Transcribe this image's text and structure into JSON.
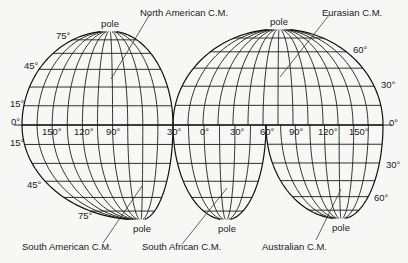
{
  "figure": {
    "type": "interrupted-projection-diagram",
    "equator_label": "0°",
    "lobes": [
      {
        "id": "north-american",
        "label": "North American C.M.",
        "hemisphere": "north",
        "pole_label": "pole"
      },
      {
        "id": "eurasian",
        "label": "Eurasian C.M.",
        "hemisphere": "north",
        "pole_label": "pole"
      },
      {
        "id": "south-american",
        "label": "South American C.M.",
        "hemisphere": "south",
        "pole_label": "pole"
      },
      {
        "id": "south-african",
        "label": "South African C.M.",
        "hemisphere": "south",
        "pole_label": "pole"
      },
      {
        "id": "australian",
        "label": "Australian C.M.",
        "hemisphere": "south",
        "pole_label": "pole"
      }
    ],
    "latitude_labels_left": [
      "75°",
      "45°",
      "15°",
      "0°",
      "15°",
      "45°",
      "75°"
    ],
    "latitude_labels_right": [
      "60°",
      "30°",
      "0°",
      "30°",
      "60°"
    ],
    "longitude_labels": [
      "150°",
      "120°",
      "90°",
      "30°",
      "0°",
      "30°",
      "60°",
      "90°",
      "120°",
      "150°"
    ]
  },
  "labels": {
    "pole": "pole",
    "na_cm": "North American C.M.",
    "eu_cm": "Eurasian C.M.",
    "sa_cm": "South American C.M.",
    "saf_cm": "South African C.M.",
    "au_cm": "Australian C.M.",
    "lat_left": {
      "n75": "75°",
      "n45": "45°",
      "n15": "15°",
      "eq": "0°",
      "s15": "15°",
      "s45": "45°",
      "s75": "75°"
    },
    "lat_right": {
      "n60": "60°",
      "n30": "30°",
      "eq": "0°",
      "s30": "30°",
      "s60": "60°"
    },
    "lon": {
      "w150": "150°",
      "w120": "120°",
      "w90": "90°",
      "w30": "30°",
      "e0": "0°",
      "e30": "30°",
      "e60": "60°",
      "e90": "90°",
      "e120": "120°",
      "e150": "150°"
    }
  }
}
